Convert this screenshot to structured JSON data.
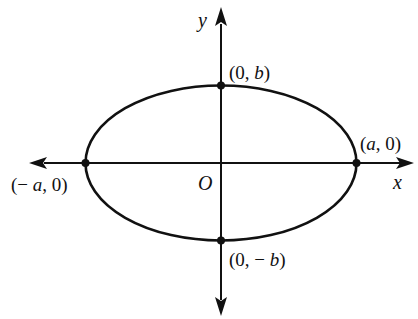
{
  "diagram": {
    "type": "ellipse-on-axes",
    "colors": {
      "stroke": "#111111",
      "background": "#ffffff"
    },
    "axes": {
      "x_label": "x",
      "y_label": "y",
      "origin_label": "O"
    },
    "points": [
      {
        "id": "top",
        "label": "(0, b)",
        "parts": [
          "(0, ",
          "b",
          ")"
        ]
      },
      {
        "id": "bottom",
        "label": "(0, − b)",
        "parts": [
          "(0, − ",
          "b",
          ")"
        ]
      },
      {
        "id": "right",
        "label": "(a, 0)",
        "parts": [
          "(",
          "a",
          ", 0)"
        ]
      },
      {
        "id": "left",
        "label": "(− a, 0)",
        "parts": [
          "(− ",
          "a",
          ", 0)"
        ]
      }
    ]
  }
}
